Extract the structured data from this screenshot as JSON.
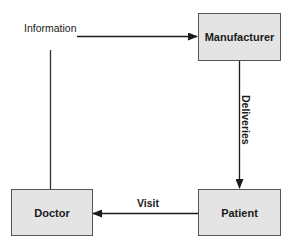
{
  "diagram": {
    "type": "flow",
    "nodes": [
      {
        "id": "manufacturer",
        "label": "Manufacturer"
      },
      {
        "id": "patient",
        "label": "Patient"
      },
      {
        "id": "doctor",
        "label": "Doctor"
      }
    ],
    "edges": [
      {
        "from": "doctor",
        "to": "manufacturer",
        "label": "Information"
      },
      {
        "from": "manufacturer",
        "to": "patient",
        "label": "Deliveries"
      },
      {
        "from": "patient",
        "to": "doctor",
        "label": "Visit"
      }
    ],
    "colors": {
      "node_fill": "#e4e4e4",
      "node_border": "#555555",
      "line": "#1a1a1a"
    }
  }
}
